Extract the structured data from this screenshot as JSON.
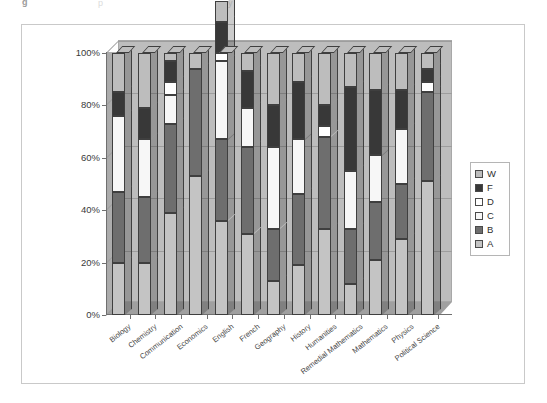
{
  "page": {
    "top_fragment_left": "g",
    "top_fragment_mid": "p",
    "top_fragment_right": "y"
  },
  "legend": {
    "position": "right",
    "items": [
      {
        "label": "W",
        "color": "#bdbdbd"
      },
      {
        "label": "F",
        "color": "#383838"
      },
      {
        "label": "D",
        "color": "#ffffff"
      },
      {
        "label": "C",
        "color": "#f7f7f7"
      },
      {
        "label": "B",
        "color": "#6e6e6e"
      },
      {
        "label": "A",
        "color": "#c4c4c4"
      }
    ]
  },
  "axes": {
    "y_ticks": [
      "0%",
      "20%",
      "40%",
      "60%",
      "80%",
      "100%"
    ],
    "y_values": [
      0,
      20,
      40,
      60,
      80,
      100
    ]
  },
  "chart_data": {
    "type": "bar",
    "subtype": "stacked-100-percent-3d-column",
    "title": "",
    "xlabel": "",
    "ylabel": "",
    "ylim": [
      0,
      100
    ],
    "grid": true,
    "legend_position": "right",
    "categories": [
      "Biology",
      "Chemistry",
      "Communication",
      "Economics",
      "English",
      "French",
      "Geography",
      "History",
      "Humanities",
      "Remedial Mathematics",
      "Mathematics",
      "Physics",
      "Political Science"
    ],
    "series": [
      {
        "name": "A",
        "color": "#c4c4c4",
        "values": [
          20,
          20,
          39,
          53,
          36,
          31,
          13,
          19,
          33,
          12,
          21,
          29,
          51
        ]
      },
      {
        "name": "B",
        "color": "#6e6e6e",
        "values": [
          27,
          25,
          34,
          41,
          31,
          33,
          20,
          27,
          35,
          21,
          22,
          21,
          34
        ]
      },
      {
        "name": "C",
        "color": "#f7f7f7",
        "values": [
          29,
          22,
          11,
          0,
          30,
          15,
          31,
          21,
          0,
          22,
          18,
          21,
          0
        ]
      },
      {
        "name": "D",
        "color": "#ffffff",
        "values": [
          0,
          0,
          5,
          0,
          3,
          0,
          0,
          0,
          4,
          0,
          0,
          0,
          4
        ]
      },
      {
        "name": "F",
        "color": "#383838",
        "values": [
          9,
          12,
          8,
          0,
          12,
          14,
          16,
          22,
          8,
          32,
          25,
          15,
          5
        ]
      },
      {
        "name": "W",
        "color": "#bdbdbd",
        "values": [
          15,
          21,
          3,
          6,
          8,
          7,
          20,
          11,
          20,
          13,
          14,
          14,
          6
        ]
      }
    ]
  }
}
